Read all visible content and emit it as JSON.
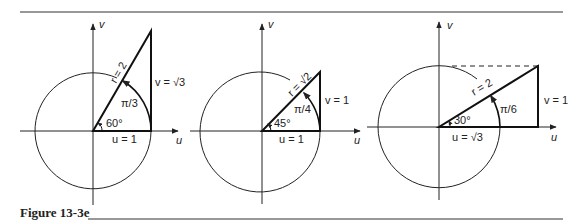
{
  "caption": "Figure 13-3e",
  "colors": {
    "ink": "#222222",
    "background": "#ffffff"
  },
  "figures": [
    {
      "id": "fig-60",
      "axis_u": "u",
      "axis_v": "v",
      "radius_label": "r = 2",
      "angle_deg_label": "60°",
      "angle_rad_label": "π/3",
      "u_label": "u = 1",
      "v_label": "v = √3"
    },
    {
      "id": "fig-45",
      "axis_u": "u",
      "axis_v": "v",
      "radius_label": "r = √2",
      "angle_deg_label": "45°",
      "angle_rad_label": "π/4",
      "u_label": "u = 1",
      "v_label": "v = 1"
    },
    {
      "id": "fig-30",
      "axis_u": "u",
      "axis_v": "v",
      "radius_label": "r = 2",
      "angle_deg_label": "30°",
      "angle_rad_label": "π/6",
      "u_label": "u = √3",
      "v_label": "v = 1"
    }
  ]
}
